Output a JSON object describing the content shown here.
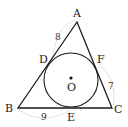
{
  "diagram": {
    "type": "triangle-incircle",
    "colors": {
      "stroke": "#1a1a1a",
      "arc": "#b8b8b8",
      "text": "#222222"
    },
    "vertices": [
      {
        "name": "A",
        "x": 77,
        "y": 22
      },
      {
        "name": "B",
        "x": 18,
        "y": 108
      },
      {
        "name": "C",
        "x": 112,
        "y": 108
      }
    ],
    "incircle": {
      "center_label": "O",
      "cx": 71,
      "cy": 80,
      "r": 27
    },
    "tangent_points": [
      {
        "name": "D",
        "on": "AB"
      },
      {
        "name": "E",
        "on": "BC"
      },
      {
        "name": "F",
        "on": "CA"
      }
    ],
    "labels": {
      "A": "A",
      "B": "B",
      "C": "C",
      "D": "D",
      "E": "E",
      "F": "F",
      "O": "O"
    },
    "lengths": [
      {
        "segment": "AD",
        "value": "8"
      },
      {
        "segment": "CF",
        "value": "7"
      },
      {
        "segment": "BE",
        "value": "9"
      }
    ]
  }
}
